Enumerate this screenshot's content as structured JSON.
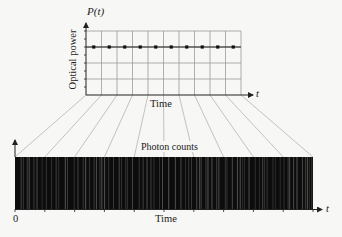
{
  "top_plot": {
    "y_symbol": "P(t)",
    "y_label": "Optical power",
    "x_label": "Time",
    "x_symbol": "t",
    "columns": 10,
    "rows": 4,
    "dot_count": 10
  },
  "bottom_plot": {
    "title": "Photon counts",
    "x_label": "Time",
    "x_symbol": "t",
    "origin_label": "0",
    "tick_count": 11
  },
  "colors": {
    "grid": "#9a9a9a",
    "axis": "#222222",
    "bar": "#0c0c0c",
    "photon_line": "#8a8a8a",
    "projection": "#aaaaaa"
  },
  "chart_data": {
    "type": "diagram",
    "panels": [
      {
        "name": "optical power",
        "xlabel": "Time",
        "ylabel": "Optical power",
        "y_symbol": "P(t)",
        "series": "constant",
        "points": 10
      },
      {
        "name": "photon counts",
        "xlabel": "Time",
        "label": "Photon counts",
        "x_origin": "0"
      }
    ]
  }
}
